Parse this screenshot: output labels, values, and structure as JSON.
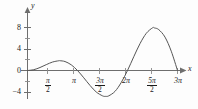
{
  "chart_data": {
    "type": "line",
    "title": "",
    "subtitle": "",
    "xlabel": "x",
    "ylabel": "y",
    "function": "y = x sin(x)",
    "grid": false,
    "legend": false,
    "xlim": [
      -0.35,
      10.2
    ],
    "ylim": [
      -5.6,
      9.2
    ],
    "x_axis": {
      "label": "x",
      "arrow": true,
      "tick_labels": [
        "π/2",
        "π",
        "3π/2",
        "2π",
        "5π/2",
        "3π"
      ],
      "tick_values": [
        1.5708,
        3.1416,
        4.7124,
        6.2832,
        7.854,
        9.4248
      ],
      "minor_ticks": [
        1.5708,
        3.1416,
        4.7124,
        6.2832,
        7.854,
        9.4248
      ]
    },
    "y_axis": {
      "label": "y",
      "arrow": true,
      "tick_labels": [
        "8",
        "4",
        "0",
        "−4"
      ],
      "tick_values": [
        8,
        4,
        0,
        -4
      ],
      "minor_tick_values": [
        6,
        2,
        -2
      ]
    },
    "series": [
      {
        "name": "y = x sin(x)",
        "color": "#555555",
        "x": [
          0,
          0.1571,
          0.3142,
          0.4712,
          0.6283,
          0.7854,
          0.9425,
          1.0996,
          1.2566,
          1.4137,
          1.5708,
          1.7279,
          1.885,
          2.042,
          2.1991,
          2.3562,
          2.5133,
          2.6704,
          2.8274,
          2.9845,
          3.1416,
          3.2987,
          3.4558,
          3.6128,
          3.7699,
          3.927,
          4.0841,
          4.2412,
          4.3982,
          4.5553,
          4.7124,
          4.8695,
          5.0265,
          5.1836,
          5.3407,
          5.4978,
          5.6549,
          5.8119,
          5.969,
          6.1261,
          6.2832,
          6.4403,
          6.5973,
          6.7544,
          6.9115,
          7.0686,
          7.2257,
          7.3827,
          7.5398,
          7.6969,
          7.854,
          8.0111,
          8.1681,
          8.3252,
          8.4823,
          8.6394,
          8.7965,
          8.9535,
          9.1106,
          9.2677,
          9.4248
        ],
        "y": [
          0,
          0.0246,
          0.0957,
          0.2071,
          0.3512,
          0.5187,
          0.6996,
          0.8833,
          1.0594,
          1.2181,
          1.3505,
          1.4492,
          1.5085,
          1.5249,
          1.4973,
          1.4268,
          1.3173,
          1.1748,
          1.0077,
          0.8259,
          0.6403,
          0.4621,
          0.3021,
          0.17,
          0.073,
          0.0155,
          0.0,
          -0.0416,
          -0.3265,
          -0.8676,
          -1.6604,
          -2.6876,
          -3.9183,
          -5.3076,
          -6.7971,
          -8.3156,
          -9.7816,
          -11.1061,
          -12.1974,
          -12.9646,
          -13.3232,
          -13.2,
          -12.5376,
          -11.2996,
          -9.474,
          -7.077,
          -4.1545,
          -0.7821,
          2.9347,
          6.8707,
          10.8849,
          14.8252,
          18.5339,
          21.8539,
          24.636,
          26.7455,
          28.0692,
          28.5222,
          28.0529,
          26.6469,
          24.3288
        ],
        "_note": "see curve_points for the actual plotted samples"
      }
    ],
    "curve_points": [
      {
        "x": 0,
        "y": 0
      },
      {
        "x": 0.3927,
        "y": 0.1503
      },
      {
        "x": 0.7854,
        "y": 0.5554
      },
      {
        "x": 1.1781,
        "y": 1.0889
      },
      {
        "x": 1.5708,
        "y": 1.5708
      },
      {
        "x": 1.9635,
        "y": 1.8141
      },
      {
        "x": 2.0344,
        "y": 1.8197
      },
      {
        "x": 2.3562,
        "y": 1.6661
      },
      {
        "x": 2.7489,
        "y": 1.0521
      },
      {
        "x": 3.1416,
        "y": 0
      },
      {
        "x": 3.5343,
        "y": -1.3526
      },
      {
        "x": 3.927,
        "y": -2.7768
      },
      {
        "x": 4.3197,
        "y": -4.0011
      },
      {
        "x": 4.7124,
        "y": -4.7124
      },
      {
        "x": 4.9132,
        "y": -4.8145
      },
      {
        "x": 5.1051,
        "y": -4.7124
      },
      {
        "x": 5.4978,
        "y": -3.8862
      },
      {
        "x": 5.8905,
        "y": -2.2225
      },
      {
        "x": 6.2832,
        "y": 0
      },
      {
        "x": 6.6759,
        "y": 2.5564
      },
      {
        "x": 7.0686,
        "y": 4.9977
      },
      {
        "x": 7.4613,
        "y": 6.9119
      },
      {
        "x": 7.854,
        "y": 7.9373
      },
      {
        "x": 7.9787,
        "y": 7.9167
      },
      {
        "x": 8.2467,
        "y": 7.6026
      },
      {
        "x": 8.6394,
        "y": 6.2126
      },
      {
        "x": 9.0321,
        "y": 3.5882
      },
      {
        "x": 9.4248,
        "y": 0
      }
    ],
    "key_points": {
      "zeros": [
        0,
        3.1416,
        6.2832,
        9.4248
      ],
      "local_max_1": {
        "x": 2.03,
        "y": 1.82
      },
      "local_min": {
        "x": 4.91,
        "y": -4.81
      },
      "local_max_2": {
        "x": 7.98,
        "y": 7.92
      }
    },
    "colors": {
      "curve": "#555555",
      "axis": "#6e6e6e",
      "text": "#1b1b1b",
      "background": "#fdfdfd"
    }
  },
  "labels": {
    "y_axis_name": "y",
    "x_axis_name": "x",
    "y_8": "8",
    "y_4": "4",
    "y_0": "0",
    "y_neg4": "−4",
    "pi_over_2_num": "π",
    "pi_over_2_den": "2",
    "pi": "π",
    "three_pi_over_2_num": "3π",
    "three_pi_over_2_den": "2",
    "two_pi": "2π",
    "five_pi_over_2_num": "5π",
    "five_pi_over_2_den": "2",
    "three_pi": "3π"
  }
}
